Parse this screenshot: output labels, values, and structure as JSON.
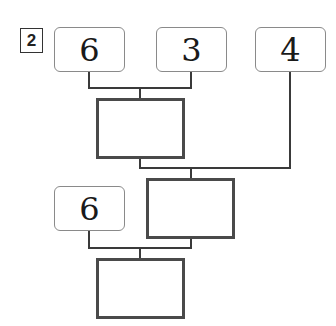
{
  "problem": {
    "number": "2"
  },
  "diagram": {
    "inputs_top": [
      "6",
      "3",
      "4"
    ],
    "input_bottom": "6",
    "answer_boxes": [
      "",
      "",
      ""
    ],
    "colors": {
      "line": "#3a3a3a",
      "input_border": "#8a8a8a",
      "answer_border": "#4a4a4a"
    }
  }
}
